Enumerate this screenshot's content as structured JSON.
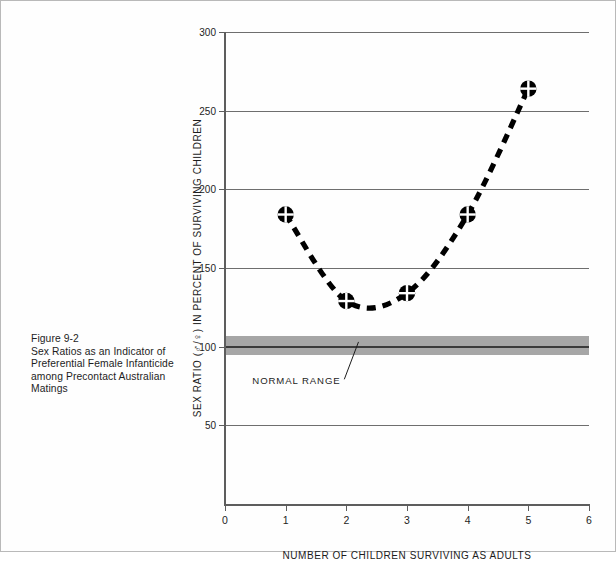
{
  "figure": {
    "caption_lines": [
      "Figure 9-2",
      "Sex Ratios as an Indicator of",
      "Preferential Female Infanticide",
      "among Precontact Australian",
      "Matings"
    ],
    "caption_label": "Figure 9-2",
    "caption_title": "Sex Ratios as an Indicator of Preferential Female Infanticide among Precontact Australian Matings"
  },
  "chart_data": {
    "type": "line",
    "title": "",
    "subtitle": "",
    "xlabel": "NUMBER OF CHILDREN SURVIVING AS ADULTS",
    "ylabel": "SEX RATIO (♂/♀) IN PERCENT OF SURVIVING CHILDREN",
    "ylabel_prefix": "SEX RATIO (",
    "ylabel_symbol_male": "♂",
    "ylabel_symbol_slash": "/",
    "ylabel_symbol_female": "♀",
    "ylabel_suffix": ") IN PERCENT OF SURVIVING CHILDREN",
    "x": [
      1,
      2,
      3,
      4,
      5
    ],
    "values": [
      184,
      129,
      134,
      184,
      264
    ],
    "series": [
      {
        "name": "Sex ratio",
        "x": [
          1,
          2,
          3,
          4,
          5
        ],
        "values": [
          184,
          129,
          134,
          184,
          264
        ],
        "marker": "circle-plus",
        "linestyle": "dashed",
        "color": "#000000"
      }
    ],
    "xlim": [
      0,
      6
    ],
    "ylim": [
      0,
      300
    ],
    "xticks": [
      0,
      1,
      2,
      3,
      4,
      5,
      6
    ],
    "xtick_labels": [
      "0",
      "1",
      "2",
      "3",
      "4",
      "5",
      "6"
    ],
    "yticks": [
      50,
      100,
      150,
      200,
      250,
      300
    ],
    "ytick_labels": [
      "50",
      "100",
      "150",
      "200",
      "250",
      "300"
    ],
    "grid": true,
    "grid_axis": "y",
    "legend": false,
    "annotations": [
      {
        "text": "NORMAL RANGE",
        "label_x": 0.45,
        "label_y": 78,
        "leader_to_x": 2.2,
        "leader_to_y": 103
      }
    ],
    "bands": [
      {
        "name": "normal-range",
        "y_low": 95,
        "y_high": 107,
        "center": 100,
        "fill": "#a6a6a6",
        "center_color": "#3a3a3a"
      }
    ]
  },
  "colors": {
    "ink": "#1a1a1a",
    "grid": "#6e6e6e",
    "axis": "#5d5d5d",
    "band": "#a6a6a6",
    "band_center": "#3a3a3a",
    "page_border": "#b9b9b9"
  }
}
